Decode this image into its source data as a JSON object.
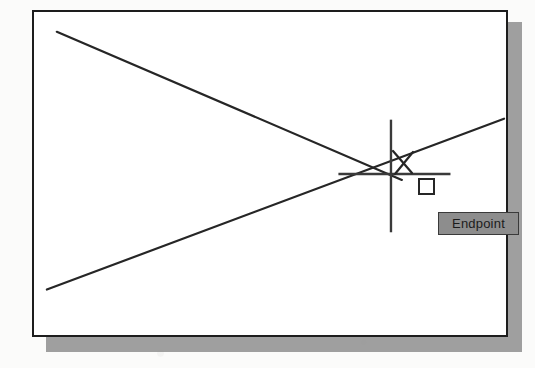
{
  "figure": {
    "background_color": "#fbfbfa",
    "frame": {
      "border_color": "#1d1d1d",
      "fill_color": "#ffffff",
      "shadow_color": "#8e8e8e"
    }
  },
  "annotations": {
    "x_marker": {
      "label": "X",
      "name": "crossing-point-x-marker",
      "color": "#262626"
    }
  },
  "cursor": {
    "type": "crosshair",
    "color": "#3a3a3a",
    "center_x": 392,
    "center_y": 174,
    "marker": {
      "shape": "square",
      "name": "endpoint-snap-marker",
      "color": "#262626",
      "size": 17
    }
  },
  "tooltip": {
    "label": "Endpoint",
    "background_color": "#8d8d8d",
    "border_color": "#3a3a3a",
    "text_color": "#1c1c1c"
  },
  "geometry": {
    "line_color": "#262626",
    "lines": [
      {
        "name": "descending-line",
        "x1": 55,
        "y1": 30,
        "x2": 403,
        "y2": 180
      },
      {
        "name": "ascending-line",
        "x1": 45,
        "y1": 291,
        "x2": 506,
        "y2": 118
      }
    ],
    "crosshair": {
      "horizontal": {
        "x1": 339,
        "y1": 174,
        "x2": 452,
        "y2": 174
      },
      "vertical": {
        "x1": 392,
        "y1": 119,
        "x2": 392,
        "y2": 233
      }
    }
  }
}
